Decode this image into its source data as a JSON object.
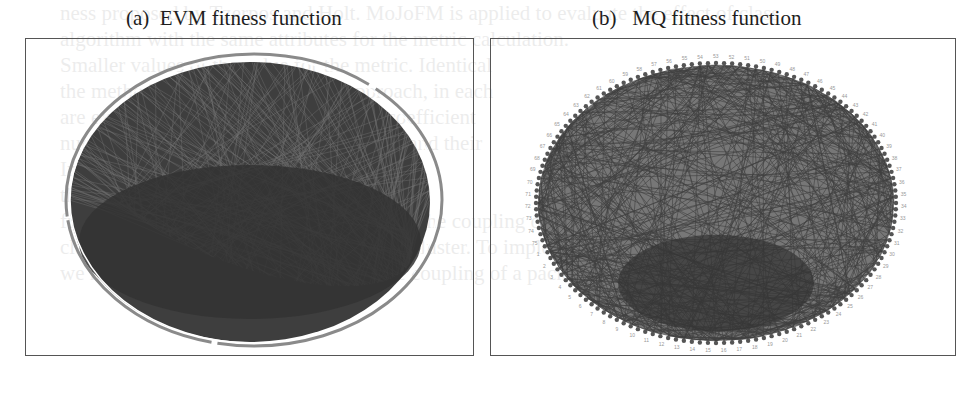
{
  "figure": {
    "panels": [
      {
        "id": "a",
        "caption": "(a)  EVM fitness function",
        "graph_type": "circular-layout dependency graph",
        "edge_color": "#3a3a3a"
      },
      {
        "id": "b",
        "caption": "(b)   MQ fitness function",
        "graph_type": "circular-layout dependency graph",
        "edge_color": "#4a4a4a",
        "node_labels_top": [
          "61",
          "63",
          "59",
          "58",
          "57",
          "56",
          "55",
          "54",
          "62",
          "52",
          "51",
          "50",
          "49",
          "46",
          "47",
          "48",
          "45",
          "44",
          "43",
          "42",
          "41",
          "40",
          "39"
        ],
        "node_labels_right": [
          "35",
          "37",
          "36",
          "35",
          "34",
          "33",
          "32",
          "31",
          "30",
          "29",
          "28",
          "27",
          "26",
          "25",
          "24",
          "23",
          "22",
          "21",
          "20",
          "19",
          "18",
          "17",
          "16",
          "15",
          "14",
          "13",
          "12",
          "11",
          "10",
          "9",
          "8",
          "7",
          "6",
          "5",
          "4",
          "3",
          "2",
          "1"
        ],
        "node_labels_left": [
          "65",
          "66",
          "67",
          "68",
          "69",
          "70",
          "71",
          "72",
          "73"
        ]
      }
    ]
  },
  "background_text": [
    "ness proposed by Tzerpos and Holt. MoJoFM is applied to evaluate the effect of class",
    "algorithm with the same attributes for the metric calculation.",
    "Smaller values of the value for the metric. Identical",
    "the method. Here assume another approach, in each",
    "are expected results of parameters and coefficient",
    "number of the quality of the experiments and their",
    "In some cases, we need to send the results",
    "this can be used to measure EVM fitness",
    "function. However, the MQ also considers the coupling of",
    "classes and the number of classes in each cluster. To implement it",
    "we have adapted the quality measure, the coupling of a package"
  ]
}
